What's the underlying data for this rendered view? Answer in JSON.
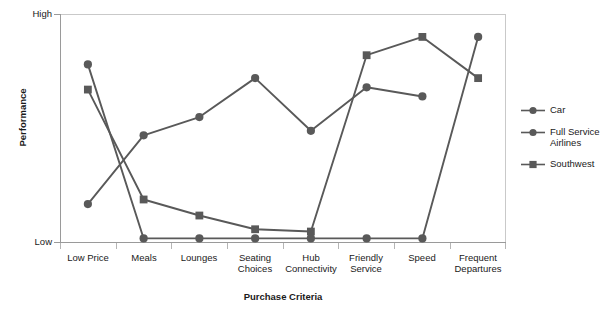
{
  "chart_data": {
    "type": "line",
    "title": "",
    "xlabel": "Purchase Criteria",
    "ylabel": "Performance",
    "categories": [
      "Low Price",
      "Meals",
      "Lounges",
      "Seating\nChoices",
      "Hub\nConnectivity",
      "Friendly\nService",
      "Speed",
      "Frequent\nDepartures"
    ],
    "ytick_labels": [
      "High",
      "Low"
    ],
    "ylim": [
      0,
      100
    ],
    "ylim_labels": [
      "Low",
      "High"
    ],
    "grid": false,
    "legend_position": "right",
    "series": [
      {
        "name": "Car",
        "marker": "circle",
        "color": "#595959",
        "values": [
          78,
          2,
          2,
          2,
          2,
          2,
          2,
          90
        ]
      },
      {
        "name": "Full Service\nAirlines",
        "marker": "circle",
        "color": "#595959",
        "values": [
          17,
          47,
          55,
          72,
          49,
          68,
          64,
          null
        ]
      },
      {
        "name": "Southwest",
        "marker": "square",
        "color": "#595959",
        "values": [
          67,
          19,
          12,
          6,
          5,
          82,
          90,
          72
        ]
      }
    ]
  },
  "axis": {
    "y_title": "Performance",
    "y_high": "High",
    "y_low": "Low",
    "x_title": "Purchase Criteria"
  },
  "categories": {
    "c0": "Low Price",
    "c1": "Meals",
    "c2": "Lounges",
    "c3": "Seating\nChoices",
    "c4": "Hub\nConnectivity",
    "c5": "Friendly\nService",
    "c6": "Speed",
    "c7": "Frequent\nDepartures"
  },
  "legend": {
    "items": [
      {
        "label": "Car",
        "marker": "circle",
        "color": "#595959"
      },
      {
        "label": "Full Service\nAirlines",
        "marker": "circle",
        "color": "#595959"
      },
      {
        "label": "Southwest",
        "marker": "square",
        "color": "#595959"
      }
    ]
  },
  "colors": {
    "series": "#595959",
    "plot_border": "#c9c9c9",
    "axis": "#9a9a9a",
    "text": "#1a1a1a",
    "background": "#ffffff"
  }
}
